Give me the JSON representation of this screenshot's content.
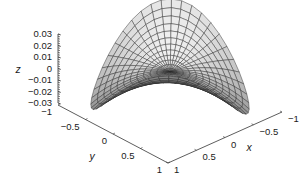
{
  "chart_data": {
    "type": "surface3d",
    "title": "",
    "xlabel": "x",
    "ylabel": "y",
    "zlabel": "z",
    "xlim": [
      -1,
      1
    ],
    "ylim": [
      -1,
      1
    ],
    "zlim": [
      -0.03,
      0.03
    ],
    "x_ticks": [
      {
        "value": 1,
        "label": "1"
      },
      {
        "value": 0.5,
        "label": "0.5"
      },
      {
        "value": 0,
        "label": "0"
      },
      {
        "value": -0.5,
        "label": "−0.5"
      },
      {
        "value": -1,
        "label": "−1"
      }
    ],
    "y_ticks": [
      {
        "value": -1,
        "label": "−1"
      },
      {
        "value": -0.5,
        "label": "−0.5"
      },
      {
        "value": 0,
        "label": "0"
      },
      {
        "value": 0.5,
        "label": "0.5"
      },
      {
        "value": 1,
        "label": "1"
      }
    ],
    "z_ticks": [
      {
        "value": 0.03,
        "label": "0.03"
      },
      {
        "value": 0.02,
        "label": "0.02"
      },
      {
        "value": 0.01,
        "label": "0.01"
      },
      {
        "value": 0,
        "label": "0"
      },
      {
        "value": -0.01,
        "label": "−0.01"
      },
      {
        "value": -0.02,
        "label": "−0.02"
      },
      {
        "value": -0.03,
        "label": "−0.03"
      }
    ],
    "surface": {
      "domain": "unit disk (polar mesh)",
      "function": "z = 0.03 * r^2 * sin(2*theta)",
      "radial_steps": 12,
      "angular_steps": 48,
      "colormap": "gray",
      "grid": false
    }
  }
}
